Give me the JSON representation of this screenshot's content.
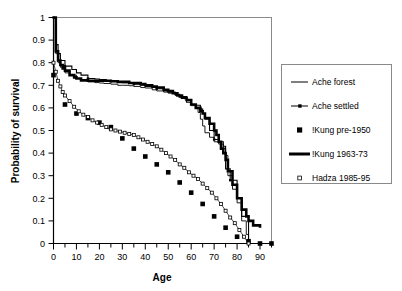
{
  "chart_data": {
    "type": "line",
    "title": "",
    "xlabel": "Age",
    "ylabel": "Probability of survival",
    "xlim": [
      0,
      95
    ],
    "ylim": [
      0,
      1
    ],
    "grid": false,
    "legend_position": "right",
    "xticks_major": [
      0,
      10,
      20,
      30,
      40,
      50,
      60,
      70,
      80,
      90
    ],
    "xtick_labels": [
      "0",
      "10",
      "20",
      "30",
      "40",
      "50",
      "60",
      "70",
      "80",
      "90"
    ],
    "xtick_minor_step": 5,
    "yticks": [
      0,
      0.1,
      0.2,
      0.3,
      0.4,
      0.5,
      0.6,
      0.7,
      0.8,
      0.9,
      1
    ],
    "ytick_labels": [
      "0",
      "0.1",
      "0.2",
      "0.3",
      "0.4",
      "0.5",
      "0.6",
      "0.7",
      "0.8",
      "0.9",
      "1"
    ],
    "series": [
      {
        "name": "Ache forest",
        "style": "thin-line",
        "marker": "none",
        "x": [
          0,
          1,
          2,
          3,
          5,
          7,
          10,
          12,
          15,
          18,
          20,
          22,
          25,
          28,
          30,
          33,
          35,
          38,
          40,
          43,
          45,
          48,
          50,
          53,
          55,
          57,
          58,
          60,
          61,
          62,
          63,
          64,
          65,
          66,
          68,
          70,
          72,
          74,
          75,
          76,
          78,
          80,
          82,
          84,
          85
        ],
        "y": [
          1.0,
          0.84,
          0.8,
          0.78,
          0.755,
          0.745,
          0.73,
          0.725,
          0.715,
          0.712,
          0.71,
          0.708,
          0.705,
          0.7,
          0.7,
          0.698,
          0.695,
          0.69,
          0.688,
          0.68,
          0.675,
          0.67,
          0.665,
          0.655,
          0.65,
          0.64,
          0.635,
          0.61,
          0.61,
          0.6,
          0.58,
          0.55,
          0.52,
          0.49,
          0.47,
          0.45,
          0.44,
          0.42,
          0.39,
          0.3,
          0.24,
          0.18,
          0.1,
          0.04,
          0.0
        ]
      },
      {
        "name": "Ache settled",
        "style": "line-with-small-markers",
        "marker": "small-filled-square",
        "x": [
          0,
          1,
          2,
          3,
          5,
          8,
          10,
          12,
          15,
          18,
          20,
          23,
          25,
          28,
          30,
          33,
          35,
          38,
          40,
          43,
          45,
          48,
          50,
          53,
          55,
          58,
          60,
          62,
          64,
          65,
          66,
          68,
          70,
          72,
          74,
          75,
          77,
          80,
          82,
          85
        ],
        "y": [
          1.0,
          0.88,
          0.84,
          0.81,
          0.785,
          0.77,
          0.755,
          0.745,
          0.73,
          0.728,
          0.725,
          0.72,
          0.718,
          0.715,
          0.712,
          0.71,
          0.705,
          0.7,
          0.695,
          0.69,
          0.685,
          0.675,
          0.67,
          0.66,
          0.65,
          0.625,
          0.615,
          0.612,
          0.595,
          0.575,
          0.55,
          0.5,
          0.46,
          0.45,
          0.43,
          0.33,
          0.28,
          0.2,
          0.12,
          0.0
        ]
      },
      {
        "name": "!Kung pre-1950",
        "style": "markers-only",
        "marker": "filled-square",
        "x": [
          0,
          5,
          10,
          15,
          20,
          25,
          30,
          35,
          40,
          45,
          50,
          55,
          60,
          65,
          70,
          75,
          80,
          85,
          90,
          95
        ],
        "y": [
          0.745,
          0.615,
          0.575,
          0.555,
          0.535,
          0.515,
          0.465,
          0.42,
          0.385,
          0.35,
          0.315,
          0.27,
          0.225,
          0.175,
          0.12,
          0.07,
          0.03,
          0.01,
          0.0,
          0.0
        ]
      },
      {
        "name": "!Kung 1963-73",
        "style": "thick-line",
        "marker": "none",
        "x": [
          0,
          1,
          2,
          3,
          4,
          5,
          7,
          9,
          10,
          12,
          15,
          18,
          20,
          22,
          25,
          28,
          30,
          33,
          35,
          38,
          40,
          43,
          45,
          48,
          50,
          52,
          54,
          56,
          58,
          60,
          62,
          64,
          65,
          66,
          68,
          70,
          71,
          72,
          73,
          74,
          75,
          76,
          78,
          80,
          82,
          84,
          85,
          87,
          90
        ],
        "y": [
          1.0,
          0.85,
          0.81,
          0.79,
          0.775,
          0.765,
          0.745,
          0.735,
          0.73,
          0.722,
          0.72,
          0.72,
          0.72,
          0.72,
          0.718,
          0.715,
          0.715,
          0.71,
          0.71,
          0.705,
          0.7,
          0.695,
          0.69,
          0.68,
          0.675,
          0.665,
          0.655,
          0.645,
          0.635,
          0.615,
          0.6,
          0.585,
          0.575,
          0.555,
          0.53,
          0.5,
          0.48,
          0.45,
          0.42,
          0.4,
          0.37,
          0.32,
          0.26,
          0.2,
          0.15,
          0.12,
          0.1,
          0.08,
          0.07
        ]
      },
      {
        "name": "Hadza 1985-95",
        "style": "open-square-markers",
        "marker": "open-square",
        "x": [
          0,
          1,
          2,
          3,
          4,
          5,
          7,
          9,
          11,
          13,
          15,
          17,
          19,
          21,
          23,
          25,
          27,
          29,
          31,
          33,
          35,
          37,
          39,
          41,
          43,
          45,
          47,
          49,
          51,
          53,
          55,
          57,
          59,
          61,
          63,
          65,
          67,
          69,
          71,
          73,
          75,
          77,
          79,
          81,
          83,
          85
        ],
        "y": [
          0.8,
          0.76,
          0.72,
          0.695,
          0.67,
          0.655,
          0.63,
          0.605,
          0.585,
          0.57,
          0.56,
          0.545,
          0.535,
          0.525,
          0.515,
          0.505,
          0.5,
          0.495,
          0.49,
          0.485,
          0.48,
          0.47,
          0.46,
          0.45,
          0.44,
          0.43,
          0.415,
          0.4,
          0.385,
          0.37,
          0.35,
          0.335,
          0.315,
          0.3,
          0.285,
          0.265,
          0.245,
          0.225,
          0.2,
          0.175,
          0.145,
          0.115,
          0.09,
          0.06,
          0.03,
          0.0
        ]
      }
    ],
    "legend_entries": [
      {
        "label": "Ache forest",
        "swatch": "thin-line"
      },
      {
        "label": "Ache settled",
        "swatch": "line-with-marker"
      },
      {
        "label": "!Kung pre-1950",
        "swatch": "filled-square"
      },
      {
        "label": "!Kung 1963-73",
        "swatch": "thick-line"
      },
      {
        "label": "Hadza 1985-95",
        "swatch": "open-square"
      }
    ],
    "colors": {
      "line": "#000000",
      "frame": "#8a8a8a",
      "background": "#ffffff"
    }
  }
}
